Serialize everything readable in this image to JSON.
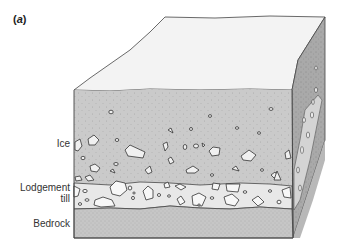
{
  "figure": {
    "panel_label_open": "(",
    "panel_label_letter": "a",
    "panel_label_close": ")",
    "labels": {
      "ice": "Ice",
      "till_line1": "Lodgement",
      "till_line2": "till",
      "bedrock": "Bedrock"
    },
    "colors": {
      "top_face": "#f3f3f3",
      "ice_front": "#cacaca",
      "till_front": "#e8e8e8",
      "bedrock_front": "#c6c6c6",
      "right_face": "#a9a9a9",
      "outline": "#444444"
    }
  }
}
